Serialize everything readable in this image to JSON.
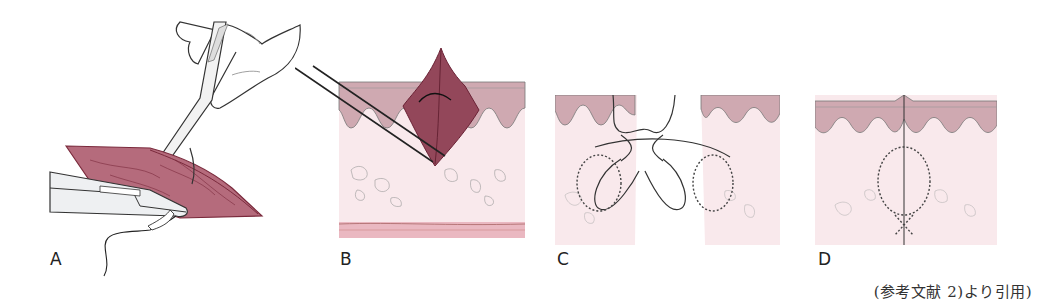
{
  "figure": {
    "panels": [
      {
        "id": "A",
        "label": "A",
        "description": "Forceps lifting tissue edge while needle holder passes suture through wound"
      },
      {
        "id": "B",
        "label": "B",
        "description": "Cross-section: forceps grasping and everting tissue flap through skin layers"
      },
      {
        "id": "C",
        "label": "C",
        "description": "Cross-section: suture loop passing through both wound edges before tying"
      },
      {
        "id": "D",
        "label": "D",
        "description": "Cross-section: closed wound with everted edges and buried suture loop"
      }
    ],
    "caption": "(参考文献 2)より引用)",
    "colors": {
      "tissue_dark": "#8a3a4c",
      "tissue_light": "#c98a97",
      "epidermis": "#c9a3ab",
      "dermis": "#f8e6ea",
      "subcutis_band": "#eab3bd",
      "line": "#333333"
    }
  }
}
